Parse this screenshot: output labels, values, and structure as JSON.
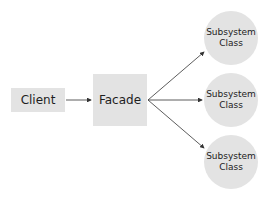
{
  "diagram": {
    "client": {
      "label": "Client"
    },
    "facade": {
      "label": "Facade"
    },
    "subsystems": [
      {
        "line1": "Subsystem",
        "line2": "Class"
      },
      {
        "line1": "Subsystem",
        "line2": "Class"
      },
      {
        "line1": "Subsystem",
        "line2": "Class"
      }
    ],
    "colors": {
      "node_fill": "#e3e3e3",
      "arrow": "#333333"
    }
  }
}
